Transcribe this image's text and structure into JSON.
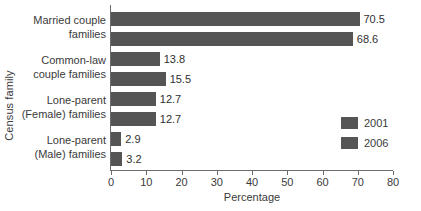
{
  "chart_data": {
    "type": "bar",
    "orientation": "horizontal",
    "title": "",
    "xlabel": "Percentage",
    "ylabel": "Census family",
    "xlim": [
      0,
      80
    ],
    "xticks": [
      0,
      10,
      20,
      30,
      40,
      50,
      60,
      70,
      80
    ],
    "grid": false,
    "legend_position": "middle-right",
    "categories": [
      "Married couple families",
      "Common-law couple families",
      "Lone-parent (Female) families",
      "Lone-parent (Male) families"
    ],
    "category_lines": [
      [
        "Married couple",
        "families"
      ],
      [
        "Common-law",
        "couple families"
      ],
      [
        "Lone-parent",
        "(Female) families"
      ],
      [
        "Lone-parent",
        "(Male) families"
      ]
    ],
    "series": [
      {
        "name": "2001",
        "color": "#555555",
        "values": [
          70.5,
          13.8,
          12.7,
          2.9
        ]
      },
      {
        "name": "2006",
        "color": "#555555",
        "values": [
          68.6,
          15.5,
          12.7,
          3.2
        ]
      }
    ],
    "data_labels": [
      [
        "70.5",
        "68.6"
      ],
      [
        "13.8",
        "15.5"
      ],
      [
        "12.7",
        "12.7"
      ],
      [
        "2.9",
        "3.2"
      ]
    ]
  },
  "legend": {
    "items": [
      {
        "label": "2001",
        "color": "#555555"
      },
      {
        "label": "2006",
        "color": "#555555"
      }
    ]
  },
  "axes": {
    "x_title": "Percentage",
    "y_title": "Census family",
    "x_tick_labels": [
      "0",
      "10",
      "20",
      "30",
      "40",
      "50",
      "60",
      "70",
      "80"
    ]
  }
}
